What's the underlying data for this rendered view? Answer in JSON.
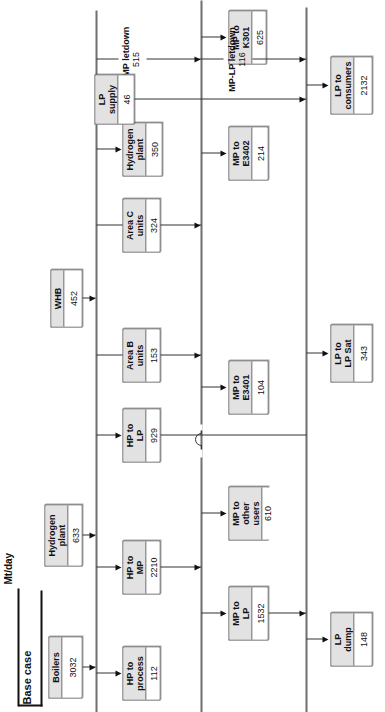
{
  "diagram": {
    "title": "Base case",
    "units_label": "Mt/day",
    "orientation": "rotated-90",
    "buses": [
      {
        "id": "hp",
        "name": "HP header"
      },
      {
        "id": "mp",
        "name": "MP header"
      },
      {
        "id": "lp",
        "name": "LP header"
      }
    ],
    "sources": [
      {
        "id": "boilers",
        "label": "Boilers",
        "value": "3032"
      },
      {
        "id": "hplant1",
        "label": "Hydrogen\nplant",
        "value": "633"
      },
      {
        "id": "whb",
        "label": "WHB",
        "value": "452"
      }
    ],
    "hp_users": [
      {
        "id": "hp-to-process",
        "label": "HP to\nprocess",
        "value": "112"
      },
      {
        "id": "hp-to-mp",
        "label": "HP to\nMP",
        "value": "2210"
      },
      {
        "id": "hp-to-lp",
        "label": "HP to\nLP",
        "value": "929"
      },
      {
        "id": "area-b",
        "label": "Area B\nunits",
        "value": "153"
      },
      {
        "id": "area-c",
        "label": "Area C\nunits",
        "value": "324"
      },
      {
        "id": "hplant2",
        "label": "Hydrogen\nplant",
        "value": "350"
      }
    ],
    "mp_users": [
      {
        "id": "mp-to-k301",
        "label": "MP to\nK301",
        "value": "625"
      },
      {
        "id": "mp-to-e3402",
        "label": "MP to\nE3402",
        "value": "214"
      },
      {
        "id": "mp-to-e3401",
        "label": "MP to\nE3401",
        "value": "104"
      },
      {
        "id": "mp-other",
        "label": "MP to\nother users",
        "value": "610"
      },
      {
        "id": "mp-to-lp",
        "label": "MP to\nLP",
        "value": "1532"
      },
      {
        "id": "lp-supply",
        "label": "LP\nsupply",
        "value": "46"
      }
    ],
    "lp_users": [
      {
        "id": "lp-consumers",
        "label": "LP to\nconsumers",
        "value": "2132"
      },
      {
        "id": "lp-to-lpsat",
        "label": "LP to\nLP Sat",
        "value": "343"
      },
      {
        "id": "lp-dump",
        "label": "LP\ndump",
        "value": "148"
      }
    ],
    "letdowns": [
      {
        "id": "hp-mp-letdown",
        "label": "HP-MP letdown",
        "value": "515"
      },
      {
        "id": "mp-lp-letdown",
        "label": "MP-LP letdown",
        "value": "116"
      }
    ]
  }
}
